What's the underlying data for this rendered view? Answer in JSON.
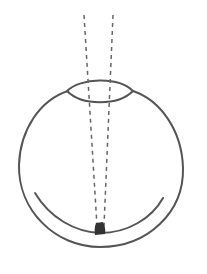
{
  "diagram": {
    "colors": {
      "background": "#ffffff",
      "stroke": "#555555",
      "ray": "#666666",
      "focal_point": "#333333"
    },
    "elements": [
      {
        "name": "eyeball",
        "type": "outline"
      },
      {
        "name": "lens",
        "type": "biconvex"
      },
      {
        "name": "retina",
        "type": "arc"
      },
      {
        "name": "light-ray-left",
        "type": "dashed-line"
      },
      {
        "name": "light-ray-right",
        "type": "dashed-line"
      },
      {
        "name": "focal-point",
        "type": "spot"
      }
    ]
  }
}
